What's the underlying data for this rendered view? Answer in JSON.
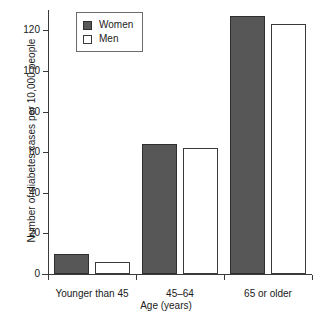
{
  "chart_data": {
    "type": "bar",
    "title": "",
    "xlabel": "Age (years)",
    "ylabel": "Number of diabetes cases per 10,000 people",
    "categories": [
      "Younger than 45",
      "45–64",
      "65 or older"
    ],
    "series": [
      {
        "name": "Women",
        "values": [
          10,
          64,
          127
        ],
        "color": "#575757"
      },
      {
        "name": "Men",
        "values": [
          6,
          62,
          123
        ],
        "color": "#ffffff"
      }
    ],
    "ylim": [
      0,
      130
    ],
    "yticks": [
      0,
      20,
      40,
      60,
      80,
      100,
      120
    ],
    "ytick_labels": [
      "0",
      "20",
      "40",
      "60",
      "80",
      "100",
      "120"
    ],
    "grid": false,
    "legend_position": "top-left",
    "legend_entries": [
      "Women",
      "Men"
    ]
  }
}
